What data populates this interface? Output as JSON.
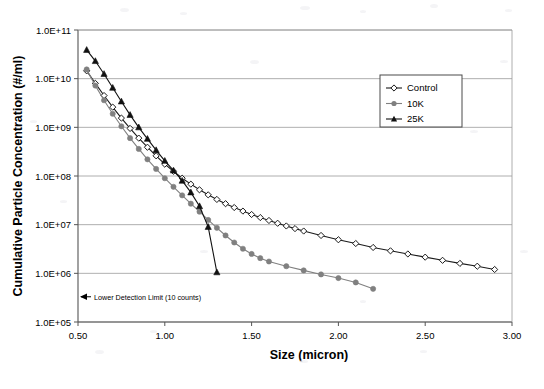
{
  "chart_data": {
    "type": "line",
    "title": "",
    "xlabel": "Size (micron)",
    "ylabel": "Cumulative Particle Concentration (#/ml)",
    "xlim": [
      0.5,
      3.0
    ],
    "ylim": [
      100000,
      100000000000
    ],
    "yscale": "log",
    "grid": "horizontal",
    "legend_position": "upper-right",
    "xticks": [
      "0.50",
      "1.00",
      "1.50",
      "2.00",
      "2.50",
      "3.00"
    ],
    "xtick_values": [
      0.5,
      1.0,
      1.5,
      2.0,
      2.5,
      3.0
    ],
    "yticks": [
      "1.0E+05",
      "1.0E+06",
      "1.0E+07",
      "1.0E+08",
      "1.0E+09",
      "1.0E+10",
      "1.0E+11"
    ],
    "ytick_values": [
      100000,
      1000000,
      10000000,
      100000000,
      1000000000,
      10000000000,
      100000000000
    ],
    "annotations": [
      {
        "text": "Lower Detection Limit (10 counts)",
        "x": 0.5,
        "y": 330000,
        "arrow": "left-arrow"
      }
    ],
    "series": [
      {
        "name": "Control",
        "marker": "open-diamond",
        "color": "#1a1a1a",
        "points": [
          [
            0.55,
            14500000000.0
          ],
          [
            0.6,
            8000000000.0
          ],
          [
            0.65,
            4500000000.0
          ],
          [
            0.7,
            2600000000.0
          ],
          [
            0.75,
            1550000000.0
          ],
          [
            0.8,
            950000000.0
          ],
          [
            0.85,
            600000000.0
          ],
          [
            0.9,
            390000000.0
          ],
          [
            0.95,
            260000000.0
          ],
          [
            1.0,
            175000000.0
          ],
          [
            1.05,
            125000000.0
          ],
          [
            1.1,
            90000000.0
          ],
          [
            1.15,
            68000000.0
          ],
          [
            1.2,
            52000000.0
          ],
          [
            1.25,
            41000000.0
          ],
          [
            1.3,
            33000000.0
          ],
          [
            1.35,
            27000000.0
          ],
          [
            1.4,
            22500000.0
          ],
          [
            1.45,
            19000000.0
          ],
          [
            1.5,
            16200000.0
          ],
          [
            1.55,
            14000000.0
          ],
          [
            1.6,
            12200000.0
          ],
          [
            1.65,
            10700000.0
          ],
          [
            1.7,
            9400000.0
          ],
          [
            1.75,
            8300000.0
          ],
          [
            1.8,
            7400000.0
          ],
          [
            1.9,
            6000000.0
          ],
          [
            2.0,
            4900000.0
          ],
          [
            2.1,
            4100000.0
          ],
          [
            2.2,
            3400000.0
          ],
          [
            2.3,
            2900000.0
          ],
          [
            2.4,
            2500000.0
          ],
          [
            2.5,
            2150000.0
          ],
          [
            2.6,
            1850000.0
          ],
          [
            2.7,
            1600000.0
          ],
          [
            2.8,
            1400000.0
          ],
          [
            2.9,
            1200000.0
          ]
        ]
      },
      {
        "name": "10K",
        "marker": "filled-circle",
        "color": "#808080",
        "points": [
          [
            0.55,
            15500000000.0
          ],
          [
            0.6,
            7200000000.0
          ],
          [
            0.65,
            3600000000.0
          ],
          [
            0.7,
            1900000000.0
          ],
          [
            0.75,
            1050000000.0
          ],
          [
            0.8,
            600000000.0
          ],
          [
            0.85,
            360000000.0
          ],
          [
            0.9,
            220000000.0
          ],
          [
            0.95,
            140000000.0
          ],
          [
            1.0,
            90000000.0
          ],
          [
            1.05,
            60000000.0
          ],
          [
            1.1,
            40000000.0
          ],
          [
            1.15,
            27000000.0
          ],
          [
            1.2,
            18500000.0
          ],
          [
            1.25,
            12500000.0
          ],
          [
            1.3,
            8600000.0
          ],
          [
            1.35,
            6000000.0
          ],
          [
            1.4,
            4300000.0
          ],
          [
            1.45,
            3200000.0
          ],
          [
            1.5,
            2500000.0
          ],
          [
            1.55,
            2050000.0
          ],
          [
            1.6,
            1750000.0
          ],
          [
            1.7,
            1400000.0
          ],
          [
            1.8,
            1150000.0
          ],
          [
            1.9,
            950000.0
          ],
          [
            2.0,
            800000.0
          ],
          [
            2.1,
            650000.0
          ],
          [
            2.2,
            480000.0
          ]
        ]
      },
      {
        "name": "25K",
        "marker": "filled-triangle",
        "color": "#111111",
        "points": [
          [
            0.55,
            39000000000.0
          ],
          [
            0.6,
            23000000000.0
          ],
          [
            0.65,
            12500000000.0
          ],
          [
            0.7,
            6500000000.0
          ],
          [
            0.75,
            3400000000.0
          ],
          [
            0.8,
            1800000000.0
          ],
          [
            0.85,
            1000000000.0
          ],
          [
            0.9,
            580000000.0
          ],
          [
            0.95,
            340000000.0
          ],
          [
            1.0,
            205000000.0
          ],
          [
            1.05,
            130000000.0
          ],
          [
            1.1,
            80000000.0
          ],
          [
            1.15,
            46000000.0
          ],
          [
            1.2,
            24000000.0
          ],
          [
            1.25,
            9000000.0
          ],
          [
            1.3,
            1050000.0
          ]
        ]
      }
    ]
  },
  "legend": {
    "items": [
      {
        "label": "Control"
      },
      {
        "label": "10K"
      },
      {
        "label": "25K"
      }
    ]
  }
}
